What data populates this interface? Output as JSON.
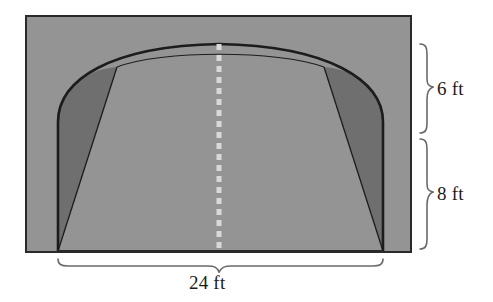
{
  "figure": {
    "type": "geometry-diagram",
    "title": "",
    "colors": {
      "background": "#ffffff",
      "rectangle_fill": "#949494",
      "arch_segment_fill": "#6f6f6f",
      "outline": "#1c1c1c",
      "rectangle_border": "#2a2a2a",
      "center_dash": "#d9d9d9",
      "brace": "#6a6a6a",
      "text": "#1b1b1b"
    },
    "dimensions": [
      {
        "name": "arch-height",
        "value": "6 ft",
        "number": 6,
        "unit": "ft",
        "orientation": "vertical",
        "side": "right",
        "brace": true
      },
      {
        "name": "wall-height",
        "value": "8 ft",
        "number": 8,
        "unit": "ft",
        "orientation": "vertical",
        "side": "right",
        "brace": true
      },
      {
        "name": "span-width",
        "value": "24 ft",
        "number": 24,
        "unit": "ft",
        "orientation": "horizontal",
        "side": "bottom",
        "brace": true
      }
    ],
    "center_line": {
      "name": "axis-of-symmetry",
      "style": "dashed",
      "color": "#d9d9d9"
    },
    "shapes": {
      "rectangle": {
        "x": 26,
        "y": 16,
        "width": 385,
        "height": 236
      },
      "arch_span_x": [
        58,
        383
      ],
      "arch_base_y": 251,
      "arch_top_y": 44,
      "arch_spring_y": 122,
      "chord_junction": [
        [
          117,
          67
        ],
        [
          324,
          67
        ]
      ]
    }
  }
}
